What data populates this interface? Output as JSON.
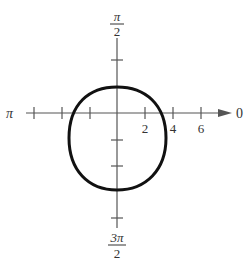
{
  "figure": {
    "type": "polar-graph",
    "axis_labels": {
      "right": "0",
      "left": "π",
      "top_num": "π",
      "top_den": "2",
      "bottom_num": "3π",
      "bottom_den": "2"
    },
    "radial_ticks": [
      "2",
      "4",
      "6"
    ],
    "curve_color": "#111111",
    "axis_color": "#555555"
  }
}
